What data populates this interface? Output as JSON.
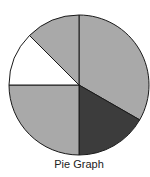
{
  "chart_data": {
    "type": "pie",
    "title": "Pie Graph",
    "categories": [
      "Slice A",
      "Slice B",
      "Slice C",
      "Slice D",
      "Slice E"
    ],
    "values": [
      33.3,
      16.7,
      25.0,
      12.5,
      12.5
    ],
    "start_angle_deg": 0,
    "direction": "clockwise",
    "colors": [
      "#a9a9a9",
      "#3c3c3c",
      "#a9a9a9",
      "#ffffff",
      "#a9a9a9"
    ],
    "labels_on_slices": false,
    "legend": "none"
  },
  "caption": "Pie Graph",
  "colors": {
    "outline": "#1a1a1a",
    "background": "#ffffff"
  }
}
